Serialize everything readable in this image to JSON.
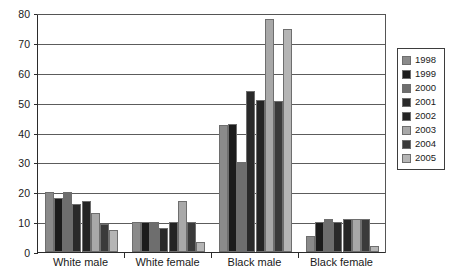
{
  "chart_data": {
    "type": "bar",
    "title": "",
    "subtitle": "",
    "xlabel": "",
    "ylabel": "",
    "ylim": [
      0,
      80
    ],
    "ytick_step": 10,
    "yticks": [
      0,
      10,
      20,
      30,
      40,
      50,
      60,
      70,
      80
    ],
    "ytick_labels": [
      "0",
      "10",
      "20",
      "30",
      "40",
      "50",
      "60",
      "70",
      "80"
    ],
    "grid": true,
    "grid_axis": "y",
    "legend_position": "right",
    "categories": [
      "White male",
      "White female",
      "Black male",
      "Black female"
    ],
    "series": [
      {
        "name": "1998",
        "color": "#8a8a8a",
        "values": [
          20,
          10,
          42.5,
          5.5
        ]
      },
      {
        "name": "1999",
        "color": "#1c1c1c",
        "values": [
          18,
          10,
          43,
          10
        ]
      },
      {
        "name": "2000",
        "color": "#6e6e6e",
        "values": [
          20,
          10,
          30,
          11
        ]
      },
      {
        "name": "2001",
        "color": "#2a2a2a",
        "values": [
          16,
          8,
          54,
          10
        ]
      },
      {
        "name": "2002",
        "color": "#242424",
        "values": [
          17,
          10,
          51,
          11
        ]
      },
      {
        "name": "2003",
        "color": "#a8a8a8",
        "values": [
          13,
          17,
          78,
          11
        ]
      },
      {
        "name": "2004",
        "color": "#3a3a3a",
        "values": [
          9.5,
          10,
          50.5,
          11
        ]
      },
      {
        "name": "2005",
        "color": "#b5b5b5",
        "values": [
          7.5,
          3.5,
          74.5,
          2
        ]
      }
    ]
  },
  "legend": {
    "entries": [
      "1998",
      "1999",
      "2000",
      "2001",
      "2002",
      "2003",
      "2004",
      "2005"
    ]
  },
  "caption_fragment": ""
}
